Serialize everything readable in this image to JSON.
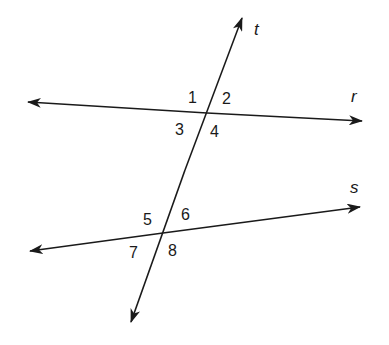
{
  "diagram": {
    "lines": [
      {
        "name": "t",
        "label": "t",
        "role": "transversal"
      },
      {
        "name": "r",
        "label": "r",
        "role": "line"
      },
      {
        "name": "s",
        "label": "s",
        "role": "line"
      }
    ],
    "angles": [
      {
        "label": "1",
        "intersection": "r-t",
        "position": "upper-left"
      },
      {
        "label": "2",
        "intersection": "r-t",
        "position": "upper-right"
      },
      {
        "label": "3",
        "intersection": "r-t",
        "position": "lower-left"
      },
      {
        "label": "4",
        "intersection": "r-t",
        "position": "lower-right"
      },
      {
        "label": "5",
        "intersection": "s-t",
        "position": "upper-left"
      },
      {
        "label": "6",
        "intersection": "s-t",
        "position": "upper-right"
      },
      {
        "label": "7",
        "intersection": "s-t",
        "position": "lower-left"
      },
      {
        "label": "8",
        "intersection": "s-t",
        "position": "lower-right"
      }
    ],
    "colors": {
      "stroke": "#1a1a1a",
      "background": "#ffffff"
    }
  }
}
